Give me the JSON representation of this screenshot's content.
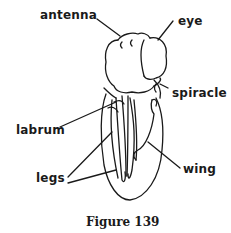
{
  "figure": {
    "caption": "Figure 139",
    "labels": {
      "antenna": "antenna",
      "eye": "eye",
      "spiracle": "spiracle",
      "labrum": "labrum",
      "legs": "legs",
      "wing": "wing"
    },
    "colors": {
      "ink": "#1a1a1a",
      "background": "#ffffff"
    }
  }
}
